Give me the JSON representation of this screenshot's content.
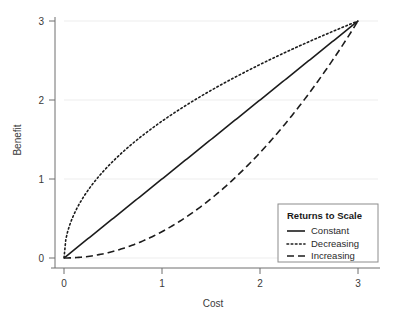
{
  "chart_data": {
    "type": "line",
    "title": "",
    "xlabel": "Cost",
    "ylabel": "Benefit",
    "xlim": [
      0,
      3
    ],
    "ylim": [
      0,
      3
    ],
    "xticks": [
      "0",
      "1",
      "2",
      "3"
    ],
    "yticks": [
      "0",
      "1",
      "2",
      "3"
    ],
    "xtick_values": [
      0,
      1,
      2,
      3
    ],
    "ytick_values": [
      0,
      1,
      2,
      3
    ],
    "grid": "horizontal",
    "legend_position": "bottom-right",
    "legend_title": "Returns to Scale",
    "series": [
      {
        "name": "Constant",
        "style": "solid",
        "x": [
          0,
          0.3,
          0.6,
          0.9,
          1.2,
          1.5,
          1.8,
          2.1,
          2.4,
          2.7,
          3
        ],
        "values": [
          0,
          0.3,
          0.6,
          0.9,
          1.2,
          1.5,
          1.8,
          2.1,
          2.4,
          2.7,
          3
        ]
      },
      {
        "name": "Decreasing",
        "style": "dotted",
        "x": [
          0,
          0.3,
          0.6,
          0.9,
          1.2,
          1.5,
          1.8,
          2.1,
          2.4,
          2.7,
          3
        ],
        "values": [
          0,
          0.95,
          1.34,
          1.64,
          1.9,
          2.12,
          2.32,
          2.51,
          2.68,
          2.85,
          3
        ]
      },
      {
        "name": "Increasing",
        "style": "dashed",
        "x": [
          0,
          0.3,
          0.6,
          0.9,
          1.2,
          1.5,
          1.8,
          2.1,
          2.4,
          2.7,
          3
        ],
        "values": [
          0,
          0.03,
          0.12,
          0.27,
          0.48,
          0.75,
          1.08,
          1.47,
          1.92,
          2.43,
          3
        ]
      }
    ],
    "colors": {
      "line": "#1c1c1c",
      "grid": "#ededed",
      "axis": "#6e6e6e",
      "legend_border": "#8c8c8c",
      "background": "#ffffff"
    }
  },
  "axes": {
    "x_title": "Cost",
    "y_title": "Benefit",
    "x_tick_labels": [
      "0",
      "1",
      "2",
      "3"
    ],
    "y_tick_labels": [
      "0",
      "1",
      "2",
      "3"
    ]
  },
  "legend": {
    "title": "Returns to Scale",
    "items": [
      {
        "label": "Constant",
        "style": "solid"
      },
      {
        "label": "Decreasing",
        "style": "dotted"
      },
      {
        "label": "Increasing",
        "style": "dashed"
      }
    ]
  }
}
